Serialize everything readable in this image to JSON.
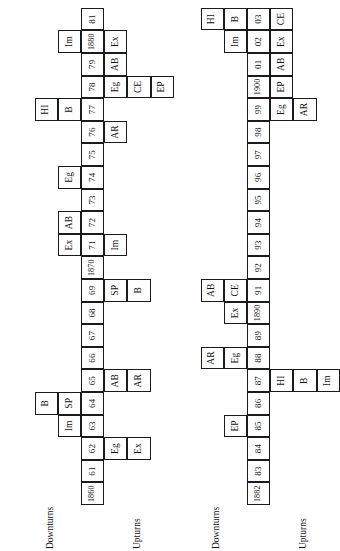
{
  "figure": {
    "type": "timeline-diagram",
    "orientation": "rotated-90-ccw",
    "panels": [
      {
        "id": "panel-1",
        "downturns_label": "Downturns",
        "upturns_label": "Upturns",
        "year_axis": [
          "1860",
          "61",
          "62",
          "63",
          "64",
          "65",
          "66",
          "67",
          "68",
          "69",
          "1870",
          "71",
          "72",
          "73",
          "74",
          "75",
          "76",
          "77",
          "78",
          "79",
          "1880",
          "81"
        ],
        "above_rows": [
          {
            "row": 1,
            "cells": [
              {
                "year": "63",
                "label": "Im"
              },
              {
                "year": "64",
                "label": "SP"
              },
              {
                "year": "72",
                "label": "AB"
              },
              {
                "year": "71",
                "label": "Ex"
              },
              {
                "year": "74",
                "label": "Eg"
              },
              {
                "year": "77",
                "label": "B"
              },
              {
                "year": "1880",
                "label": "Im"
              }
            ]
          },
          {
            "row": 2,
            "cells": [
              {
                "year": "64",
                "label": "B"
              },
              {
                "year": "77",
                "label": "HI"
              }
            ]
          }
        ],
        "below_rows": [
          {
            "row": 1,
            "cells": [
              {
                "year": "62",
                "label": "Eg"
              },
              {
                "year": "65",
                "label": "AB"
              },
              {
                "year": "69",
                "label": "SP"
              },
              {
                "year": "71",
                "label": "Im"
              },
              {
                "year": "76",
                "label": "AR"
              },
              {
                "year": "78",
                "label": "Eg"
              },
              {
                "year": "79",
                "label": "AB"
              },
              {
                "year": "1880",
                "label": "Ex"
              }
            ]
          },
          {
            "row": 2,
            "cells": [
              {
                "year": "62",
                "label": "Ex"
              },
              {
                "year": "65",
                "label": "AR"
              },
              {
                "year": "69",
                "label": "B"
              },
              {
                "year": "78",
                "label": "CE"
              }
            ]
          },
          {
            "row": 3,
            "cells": [
              {
                "year": "78",
                "label": "EP"
              }
            ]
          }
        ]
      },
      {
        "id": "panel-2",
        "downturns_label": "Downturns",
        "upturns_label": "Upturns",
        "year_axis": [
          "1882",
          "83",
          "84",
          "85",
          "86",
          "87",
          "88",
          "89",
          "1890",
          "91",
          "92",
          "93",
          "94",
          "95",
          "96",
          "97",
          "98",
          "99",
          "1900",
          "01",
          "02",
          "03"
        ],
        "above_rows": [
          {
            "row": 1,
            "cells": [
              {
                "year": "85",
                "label": "EP"
              },
              {
                "year": "88",
                "label": "Eg"
              },
              {
                "year": "1890",
                "label": "Ex"
              },
              {
                "year": "91",
                "label": "CE"
              },
              {
                "year": "02",
                "label": "Im"
              },
              {
                "year": "03",
                "label": "B"
              }
            ]
          },
          {
            "row": 2,
            "cells": [
              {
                "year": "88",
                "label": "AR"
              },
              {
                "year": "91",
                "label": "AB"
              },
              {
                "year": "03",
                "label": "HI"
              }
            ]
          }
        ],
        "below_rows": [
          {
            "row": 1,
            "cells": [
              {
                "year": "87",
                "label": "HI"
              },
              {
                "year": "99",
                "label": "Eg"
              },
              {
                "year": "1900",
                "label": "EP"
              },
              {
                "year": "01",
                "label": "AB"
              },
              {
                "year": "02",
                "label": "Ex"
              },
              {
                "year": "03",
                "label": "CE"
              }
            ]
          },
          {
            "row": 2,
            "cells": [
              {
                "year": "87",
                "label": "B"
              },
              {
                "year": "99",
                "label": "AR"
              }
            ]
          },
          {
            "row": 3,
            "cells": [
              {
                "year": "87",
                "label": "Im"
              }
            ]
          }
        ]
      }
    ],
    "legend_codes": [
      "Im",
      "SP",
      "B",
      "AB",
      "Ex",
      "Eg",
      "HI",
      "AR",
      "CE",
      "EP"
    ]
  },
  "chart_data": {
    "type": "table",
    "title": "",
    "panels": [
      "1860-1881",
      "1882-1903"
    ]
  }
}
